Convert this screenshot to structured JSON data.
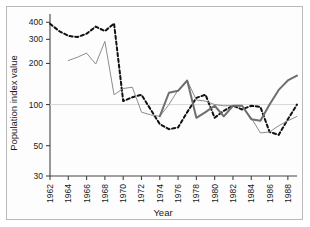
{
  "chart_data": {
    "type": "line",
    "title": "",
    "xlabel": "Year",
    "ylabel": "Population index value",
    "yscale": "log",
    "ylim": [
      30,
      430
    ],
    "xlim": [
      1962,
      1989
    ],
    "grid": false,
    "legend": "none",
    "ytick_labels": [
      "400",
      "300",
      "200",
      "100",
      "50",
      "30"
    ],
    "ytick_values": [
      400,
      300,
      200,
      100,
      50,
      30
    ],
    "xtick_labels": [
      "1962",
      "1964",
      "1966",
      "1968",
      "1970",
      "1972",
      "1974",
      "1976",
      "1978",
      "1980",
      "1982",
      "1984",
      "1986",
      "1988"
    ],
    "xtick_values": [
      1962,
      1964,
      1966,
      1968,
      1970,
      1972,
      1974,
      1976,
      1978,
      1980,
      1982,
      1984,
      1986,
      1988
    ],
    "series": [
      {
        "name": "series-dashed",
        "style": "dashed",
        "color": "#111111",
        "width": 2.0,
        "x": [
          1962,
          1963,
          1964,
          1965,
          1966,
          1967,
          1968,
          1969,
          1970,
          1971,
          1972,
          1973,
          1974,
          1975,
          1976,
          1977,
          1978,
          1979,
          1980,
          1981,
          1982,
          1983,
          1984,
          1985,
          1986,
          1987,
          1988,
          1989
        ],
        "y": [
          390,
          345,
          318,
          312,
          330,
          372,
          345,
          392,
          106,
          113,
          118,
          92,
          72,
          66,
          68,
          88,
          112,
          118,
          80,
          90,
          98,
          92,
          98,
          96,
          63,
          60,
          78,
          100
        ]
      },
      {
        "name": "series-thin-gray",
        "style": "solid",
        "color": "#8c8c8c",
        "width": 1.0,
        "x": [
          1964,
          1965,
          1966,
          1967,
          1968,
          1969,
          1970,
          1971,
          1972,
          1973,
          1974,
          1975,
          1976,
          1977,
          1978,
          1979,
          1980,
          1981,
          1982,
          1983,
          1984,
          1985,
          1986,
          1987,
          1988,
          1989
        ],
        "y": [
          210,
          222,
          238,
          198,
          290,
          118,
          131,
          134,
          88,
          84,
          82,
          100,
          128,
          150,
          108,
          106,
          100,
          98,
          98,
          98,
          80,
          62,
          63,
          70,
          76,
          82
        ]
      },
      {
        "name": "series-thick-gray",
        "style": "solid",
        "color": "#6e6e6e",
        "width": 2.0,
        "x": [
          1974,
          1975,
          1976,
          1977,
          1978,
          1979,
          1980,
          1981,
          1982,
          1983,
          1984,
          1985,
          1986,
          1987,
          1988,
          1989
        ],
        "y": [
          82,
          122,
          126,
          150,
          80,
          88,
          98,
          82,
          98,
          98,
          78,
          76,
          100,
          128,
          150,
          163
        ]
      }
    ]
  },
  "axis": {
    "ylabel": "Population index value",
    "xlabel": "Year"
  }
}
